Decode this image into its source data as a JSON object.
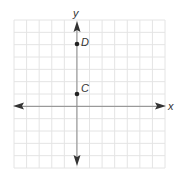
{
  "chart_data": {
    "type": "scatter",
    "title": "",
    "xlabel": "x",
    "ylabel": "y",
    "grid": true,
    "xlim": [
      -5,
      7
    ],
    "ylim": [
      -5,
      7
    ],
    "points": [
      {
        "label": "D",
        "x": 0,
        "y": 5
      },
      {
        "label": "C",
        "x": 0,
        "y": 1
      }
    ],
    "axes": {
      "x_arrows": "both",
      "y_arrows": "both"
    },
    "legend": null
  },
  "labels": {
    "x_axis": "x",
    "y_axis": "y",
    "point_d": "D",
    "point_c": "C"
  },
  "colors": {
    "grid": "#e4e4e4",
    "axis": "#8a8a8a",
    "arrow": "#333333",
    "point": "#222222"
  }
}
